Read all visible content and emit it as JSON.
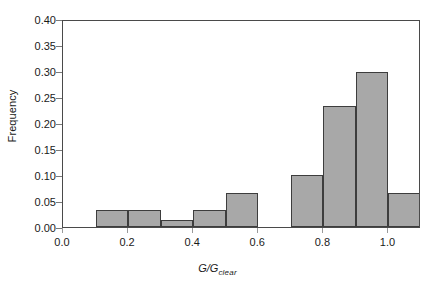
{
  "chart_data": {
    "type": "bar",
    "title": "",
    "subtitle": "",
    "xlabel": "G/Gclear",
    "xlabel_main": "G/G",
    "xlabel_sub": "clear",
    "ylabel": "Frequency",
    "xlim": [
      0.0,
      1.1
    ],
    "ylim": [
      0.0,
      0.4
    ],
    "grid": false,
    "legend": null,
    "bar_fill_color": "#a8a8a8",
    "bar_edge_color": "#3d3d3d",
    "axis_color": "#4a4a4a",
    "background_color": "#ffffff",
    "bin_width": 0.1,
    "bin_edges": [
      0.1,
      0.2,
      0.3,
      0.4,
      0.5,
      0.6,
      0.7,
      0.8,
      0.9,
      1.0,
      1.1
    ],
    "categories": [
      "0.1-0.2",
      "0.2-0.3",
      "0.3-0.4",
      "0.4-0.5",
      "0.5-0.6",
      "0.6-0.7",
      "0.7-0.8",
      "0.8-0.9",
      "0.9-1.0",
      "1.0-1.1"
    ],
    "values": [
      0.032,
      0.032,
      0.013,
      0.032,
      0.066,
      0.0,
      0.1,
      0.233,
      0.299,
      0.065
    ],
    "x_ticks": [
      0.0,
      0.2,
      0.4,
      0.6,
      0.8,
      1.0
    ],
    "x_tick_labels": [
      "0.0",
      "0.2",
      "0.4",
      "0.6",
      "0.8",
      "1.0"
    ],
    "y_ticks": [
      0.0,
      0.05,
      0.1,
      0.15,
      0.2,
      0.25,
      0.3,
      0.35,
      0.4
    ],
    "y_tick_labels": [
      "0.00",
      "0.05",
      "0.10",
      "0.15",
      "0.20",
      "0.25",
      "0.30",
      "0.35",
      "0.40"
    ]
  }
}
